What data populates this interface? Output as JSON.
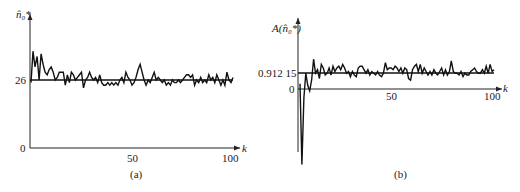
{
  "chart_data": [
    {
      "type": "line",
      "panel": "(a)",
      "ylabel": "n̂₀*",
      "xlabel": "k",
      "x_ticks": [
        "50",
        "100"
      ],
      "y_ticks": [
        "0",
        "26"
      ],
      "xlim": [
        0,
        100
      ],
      "ylim": [
        0,
        40
      ],
      "reference_line": {
        "y": 26,
        "label": "26"
      },
      "series": [
        {
          "name": "estimate",
          "x": [
            0,
            1,
            2,
            3,
            4,
            5,
            6,
            7,
            8,
            9,
            10,
            11,
            12,
            13,
            14,
            15,
            16,
            17,
            18,
            19,
            20,
            21,
            22,
            23,
            24,
            25,
            26,
            27,
            28,
            29,
            30,
            31,
            32,
            33,
            34,
            35,
            36,
            37,
            38,
            39,
            40,
            41,
            42,
            43,
            44,
            45,
            46,
            47,
            48,
            49,
            50,
            51,
            52,
            53,
            54,
            55,
            56,
            57,
            58,
            59,
            60,
            61,
            62,
            63,
            64,
            65,
            66,
            67,
            68,
            69,
            70,
            71,
            72,
            73,
            74,
            75,
            76,
            77,
            78,
            79,
            80,
            81,
            82,
            83,
            84,
            85,
            86,
            87,
            88,
            89,
            90,
            91,
            92,
            93,
            94,
            95,
            96,
            97,
            98,
            99,
            100
          ],
          "values": [
            25,
            37,
            31,
            35,
            26,
            36,
            32,
            29,
            28,
            30,
            31,
            29,
            26,
            27,
            29,
            29,
            29,
            24,
            28,
            25,
            29,
            28,
            26,
            27,
            28,
            29,
            23,
            26,
            27,
            29,
            27,
            26,
            27,
            25,
            28,
            25,
            24,
            24,
            25,
            24,
            25,
            24,
            25,
            24,
            26,
            27,
            25,
            29,
            27,
            26,
            24,
            25,
            27,
            30,
            32,
            29,
            26,
            24,
            26,
            25,
            27,
            29,
            26,
            27,
            26,
            25,
            26,
            24,
            25,
            24,
            26,
            25,
            25,
            26,
            25,
            26,
            27,
            28,
            28,
            27,
            28,
            24,
            26,
            25,
            27,
            25,
            26,
            25,
            28,
            26,
            27,
            25,
            28,
            26,
            24,
            26,
            24,
            29,
            26,
            25,
            27
          ]
        }
      ]
    },
    {
      "type": "line",
      "panel": "(b)",
      "ylabel": "A(n̂₀*)",
      "xlabel": "k",
      "x_ticks": [
        "50",
        "100"
      ],
      "y_ticks": [
        "0",
        "0.912 15"
      ],
      "xlim": [
        0,
        100
      ],
      "ylim": [
        -4.5,
        2
      ],
      "reference_line": {
        "y": 0.91215,
        "label": "0.912 15"
      },
      "series": [
        {
          "name": "A",
          "x": [
            0,
            1,
            2,
            3,
            4,
            5,
            6,
            7,
            8,
            9,
            10,
            11,
            12,
            13,
            14,
            15,
            16,
            17,
            18,
            19,
            20,
            21,
            22,
            23,
            24,
            25,
            26,
            27,
            28,
            29,
            30,
            31,
            32,
            33,
            34,
            35,
            36,
            37,
            38,
            39,
            40,
            41,
            42,
            43,
            44,
            45,
            46,
            47,
            48,
            49,
            50,
            51,
            52,
            53,
            54,
            55,
            56,
            57,
            58,
            59,
            60,
            61,
            62,
            63,
            64,
            65,
            66,
            67,
            68,
            69,
            70,
            71,
            72,
            73,
            74,
            75,
            76,
            77,
            78,
            79,
            80,
            81,
            82,
            83,
            84,
            85,
            86,
            87,
            88,
            89,
            90,
            91,
            92,
            93,
            94,
            95,
            96,
            97,
            98,
            99,
            100
          ],
          "values": [
            0.3,
            -4.3,
            -0.5,
            0.9,
            0.2,
            -0.1,
            0.5,
            1.7,
            0.9,
            1.1,
            0.6,
            1.4,
            1.2,
            0.8,
            0.9,
            1.2,
            0.8,
            1.3,
            1.0,
            1.2,
            1.3,
            1.1,
            1.4,
            1.2,
            0.9,
            1.0,
            0.7,
            1.0,
            0.8,
            0.7,
            1.2,
            1.3,
            1.3,
            1.1,
            0.9,
            1.1,
            0.8,
            1.0,
            0.9,
            0.8,
            1.0,
            0.8,
            0.7,
            0.9,
            1.5,
            1.1,
            1.2,
            1.2,
            1.1,
            1.3,
            1.2,
            1.0,
            1.2,
            0.9,
            1.2,
            1.1,
            0.6,
            0.5,
            1.1,
            1.3,
            1.4,
            1.0,
            1.4,
            0.9,
            1.2,
            1.0,
            0.8,
            1.0,
            0.8,
            1.1,
            0.9,
            0.8,
            1.0,
            1.2,
            0.8,
            1.1,
            0.8,
            1.0,
            1.6,
            1.0,
            0.9,
            0.9,
            0.8,
            1.0,
            0.7,
            0.9,
            0.8,
            0.8,
            1.0,
            1.1,
            1.2,
            1.0,
            0.9,
            0.9,
            1.1,
            0.9,
            1.3,
            0.9,
            1.4,
            1.0,
            1.1
          ]
        }
      ]
    }
  ],
  "panels": {
    "a": {
      "caption": "(a)",
      "ylabel": "n̂₀*",
      "xlabel": "k",
      "y_ref": "26",
      "y_zero": "0",
      "x_mid": "50",
      "x_end": "100"
    },
    "b": {
      "caption": "(b)",
      "ylabel": "A(n̂₀*)",
      "xlabel": "k",
      "y_ref": "0.912 15",
      "y_zero": "0",
      "x_mid": "50",
      "x_end": "100"
    }
  }
}
